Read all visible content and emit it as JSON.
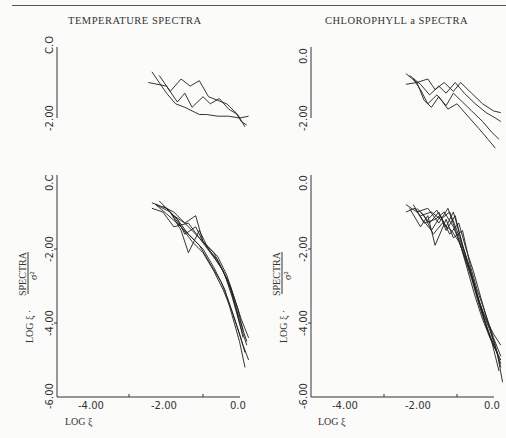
{
  "header": {
    "left_title": "TEMPERATURE SPECTRA",
    "right_title": "CHLOROPHYLL a SPECTRA"
  },
  "axes": {
    "xlabel": "LOG ξ",
    "ylabel": "LOG ξ · SPECTRA / σ²",
    "ylabel_main": "LOG ξ ·",
    "ylabel_frac_num": "SPECTRA",
    "ylabel_frac_den": "σ²",
    "x_ticks": [
      "-4.00",
      "-2.00",
      "0.0"
    ],
    "x_tick_min": "-6.00",
    "y_ticks_lower": [
      "0.0",
      "-2.00",
      "-4.00",
      "-6.00"
    ],
    "y_ticks_upper": [
      "0.0",
      "-2.00"
    ],
    "left_upper_top_tick": "C.O",
    "left_lower_top_tick": "0.C",
    "left_lower_bottom_tick": "-6.00"
  },
  "chart_data": [
    {
      "type": "line",
      "title": "TEMPERATURE SPECTRA (upper panel)",
      "xlabel": "LOG ξ",
      "ylabel": "LOG ξ · SPECTRA/σ²",
      "xlim": [
        -6.0,
        0.0
      ],
      "ylim": [
        -2.0,
        0.0
      ],
      "grid": false,
      "series": [
        {
          "name": "T1",
          "x": [
            -3.4,
            -3.0,
            -2.75,
            -2.5,
            -2.3,
            -2.1,
            -1.9,
            -1.6,
            -1.3,
            -1.0,
            -0.75
          ],
          "y": [
            -0.7,
            -1.3,
            -1.6,
            -1.7,
            -1.8,
            -1.9,
            -1.9,
            -1.95,
            -1.95,
            -2.0,
            -1.95
          ]
        },
        {
          "name": "T2",
          "x": [
            -3.2,
            -2.9,
            -2.6,
            -2.35,
            -2.1,
            -1.85,
            -1.6,
            -1.35,
            -1.1,
            -0.95,
            -0.8
          ],
          "y": [
            -0.8,
            -1.25,
            -0.9,
            -1.1,
            -0.95,
            -1.4,
            -1.5,
            -1.6,
            -1.85,
            -2.1,
            -2.2
          ]
        },
        {
          "name": "T3",
          "x": [
            -3.5,
            -3.0,
            -2.7,
            -2.5,
            -2.3,
            -2.0,
            -1.8,
            -1.55,
            -1.3,
            -1.05,
            -0.85
          ],
          "y": [
            -1.0,
            -1.1,
            -1.55,
            -1.3,
            -1.7,
            -1.4,
            -1.6,
            -1.45,
            -1.75,
            -1.9,
            -2.25
          ]
        }
      ]
    },
    {
      "type": "line",
      "title": "TEMPERATURE SPECTRA (lower panel)",
      "xlabel": "LOG ξ",
      "ylabel": "LOG ξ · SPECTRA/σ²",
      "xlim": [
        -6.0,
        0.0
      ],
      "ylim": [
        -6.0,
        0.0
      ],
      "grid": false,
      "series": [
        {
          "name": "T-a",
          "x": [
            -3.4,
            -3.0,
            -2.7,
            -2.5,
            -2.2,
            -2.0,
            -1.7,
            -1.4,
            -1.2,
            -1.0,
            -0.8
          ],
          "y": [
            -0.75,
            -0.9,
            -1.2,
            -1.6,
            -1.4,
            -1.8,
            -2.1,
            -2.7,
            -3.3,
            -4.0,
            -4.6
          ]
        },
        {
          "name": "T-b",
          "x": [
            -3.3,
            -2.9,
            -2.6,
            -2.4,
            -2.1,
            -1.85,
            -1.6,
            -1.3,
            -1.1,
            -0.9
          ],
          "y": [
            -0.8,
            -1.0,
            -1.5,
            -2.1,
            -1.5,
            -2.0,
            -2.3,
            -2.9,
            -3.6,
            -4.4
          ]
        },
        {
          "name": "T-c",
          "x": [
            -3.2,
            -2.8,
            -2.5,
            -2.2,
            -2.0,
            -1.7,
            -1.45,
            -1.2,
            -1.0,
            -0.8
          ],
          "y": [
            -0.7,
            -1.1,
            -1.3,
            -1.1,
            -1.8,
            -2.2,
            -2.6,
            -3.2,
            -3.9,
            -4.5
          ]
        },
        {
          "name": "T-d",
          "x": [
            -3.0,
            -2.7,
            -2.4,
            -2.1,
            -1.8,
            -1.5,
            -1.3,
            -1.1,
            -0.9,
            -0.75
          ],
          "y": [
            -0.9,
            -1.2,
            -1.6,
            -1.9,
            -2.4,
            -2.9,
            -3.4,
            -4.0,
            -4.6,
            -5.0
          ]
        },
        {
          "name": "T-e",
          "x": [
            -3.3,
            -3.0,
            -2.6,
            -2.3,
            -2.0,
            -1.7,
            -1.4,
            -1.2,
            -1.0,
            -0.85
          ],
          "y": [
            -0.8,
            -1.05,
            -1.4,
            -1.7,
            -2.0,
            -2.5,
            -3.1,
            -3.8,
            -4.5,
            -5.2
          ]
        },
        {
          "name": "T-f",
          "x": [
            -3.1,
            -2.8,
            -2.5,
            -2.2,
            -1.9,
            -1.6,
            -1.35,
            -1.15,
            -0.95,
            -0.75
          ],
          "y": [
            -0.85,
            -1.0,
            -1.3,
            -1.6,
            -1.9,
            -2.2,
            -2.7,
            -3.3,
            -3.9,
            -4.4
          ]
        },
        {
          "name": "T-g",
          "x": [
            -3.4,
            -3.1,
            -2.8,
            -2.4,
            -2.1,
            -1.8,
            -1.5,
            -1.25,
            -1.05,
            -0.9
          ],
          "y": [
            -0.9,
            -1.0,
            -1.4,
            -1.3,
            -1.7,
            -2.1,
            -2.5,
            -3.0,
            -3.6,
            -4.2
          ]
        },
        {
          "name": "T-h",
          "x": [
            -2.9,
            -2.6,
            -2.3,
            -2.0,
            -1.7,
            -1.45,
            -1.2,
            -1.0,
            -0.85
          ],
          "y": [
            -1.0,
            -1.4,
            -1.8,
            -2.1,
            -2.6,
            -3.1,
            -3.7,
            -4.3,
            -4.8
          ]
        }
      ]
    },
    {
      "type": "line",
      "title": "CHLOROPHYLL a SPECTRA (upper panel)",
      "xlabel": "LOG ξ",
      "ylabel": "LOG ξ · SPECTRA/σ²",
      "xlim": [
        -6.0,
        0.0
      ],
      "ylim": [
        -2.0,
        0.0
      ],
      "grid": false,
      "series": [
        {
          "name": "C1",
          "x": [
            -3.4,
            -3.1,
            -2.8,
            -2.6,
            -2.35,
            -2.1,
            -1.9,
            -1.6,
            -1.3,
            -1.0,
            -0.8
          ],
          "y": [
            -0.75,
            -1.0,
            -0.9,
            -1.2,
            -1.0,
            -1.25,
            -1.0,
            -1.3,
            -1.6,
            -1.8,
            -1.85
          ]
        },
        {
          "name": "C2",
          "x": [
            -3.3,
            -3.0,
            -2.75,
            -2.5,
            -2.3,
            -2.05,
            -1.8,
            -1.5,
            -1.2,
            -0.95,
            -0.8
          ],
          "y": [
            -0.8,
            -1.05,
            -1.35,
            -1.1,
            -1.3,
            -1.0,
            -1.3,
            -1.6,
            -1.85,
            -2.0,
            -2.1
          ]
        },
        {
          "name": "C3",
          "x": [
            -3.2,
            -3.0,
            -2.8,
            -2.55,
            -2.3,
            -2.1,
            -1.85,
            -1.6,
            -1.3,
            -1.05,
            -0.85
          ],
          "y": [
            -0.9,
            -1.2,
            -1.6,
            -1.35,
            -1.65,
            -1.3,
            -1.55,
            -1.8,
            -2.1,
            -2.4,
            -2.6
          ]
        },
        {
          "name": "C4",
          "x": [
            -3.4,
            -3.1,
            -2.9,
            -2.7,
            -2.5,
            -2.25,
            -2.0,
            -1.7,
            -1.4,
            -1.15,
            -0.95
          ],
          "y": [
            -1.05,
            -1.0,
            -1.5,
            -1.7,
            -1.4,
            -1.75,
            -1.6,
            -1.95,
            -2.3,
            -2.6,
            -2.85
          ]
        }
      ]
    },
    {
      "type": "line",
      "title": "CHLOROPHYLL a SPECTRA (lower panel)",
      "xlabel": "LOG ξ",
      "ylabel": "LOG ξ · SPECTRA/σ²",
      "xlim": [
        -6.0,
        0.0
      ],
      "ylim": [
        -6.0,
        0.0
      ],
      "grid": false,
      "series": [
        {
          "name": "C-a",
          "x": [
            -3.4,
            -3.1,
            -2.8,
            -2.5,
            -2.25,
            -2.0,
            -1.8,
            -1.6,
            -1.4,
            -1.2,
            -1.0,
            -0.8
          ],
          "y": [
            -0.8,
            -1.0,
            -0.9,
            -1.3,
            -0.9,
            -1.6,
            -2.2,
            -2.8,
            -3.5,
            -4.1,
            -4.6,
            -5.0
          ]
        },
        {
          "name": "C-b",
          "x": [
            -3.3,
            -3.0,
            -2.8,
            -2.6,
            -2.3,
            -2.1,
            -1.85,
            -1.65,
            -1.45,
            -1.2,
            -1.0,
            -0.8
          ],
          "y": [
            -0.9,
            -1.4,
            -1.1,
            -1.9,
            -1.2,
            -1.7,
            -1.5,
            -2.4,
            -3.1,
            -3.8,
            -4.4,
            -4.9
          ]
        },
        {
          "name": "C-c",
          "x": [
            -3.2,
            -2.95,
            -2.7,
            -2.45,
            -2.2,
            -1.95,
            -1.75,
            -1.55,
            -1.35,
            -1.15,
            -0.95,
            -0.8
          ],
          "y": [
            -0.8,
            -1.2,
            -1.5,
            -1.1,
            -1.6,
            -1.3,
            -2.0,
            -2.6,
            -3.3,
            -4.0,
            -4.6,
            -5.2
          ]
        },
        {
          "name": "C-d",
          "x": [
            -3.0,
            -2.75,
            -2.5,
            -2.3,
            -2.05,
            -1.85,
            -1.65,
            -1.45,
            -1.25,
            -1.05,
            -0.85
          ],
          "y": [
            -1.0,
            -1.3,
            -1.0,
            -1.5,
            -1.1,
            -1.9,
            -2.5,
            -3.2,
            -3.9,
            -4.5,
            -5.3
          ]
        },
        {
          "name": "C-e",
          "x": [
            -3.4,
            -3.15,
            -2.9,
            -2.6,
            -2.35,
            -2.1,
            -1.9,
            -1.7,
            -1.5,
            -1.3,
            -1.1,
            -0.9
          ],
          "y": [
            -1.0,
            -0.9,
            -1.3,
            -1.2,
            -1.0,
            -1.4,
            -1.9,
            -2.6,
            -3.3,
            -3.9,
            -4.4,
            -4.8
          ]
        },
        {
          "name": "C-f",
          "x": [
            -3.1,
            -2.9,
            -2.65,
            -2.4,
            -2.15,
            -1.95,
            -1.75,
            -1.55,
            -1.35,
            -1.15,
            -0.95,
            -0.8
          ],
          "y": [
            -0.9,
            -1.1,
            -1.6,
            -1.3,
            -1.5,
            -1.8,
            -2.3,
            -2.9,
            -3.6,
            -4.2,
            -4.7,
            -5.1
          ]
        },
        {
          "name": "C-g",
          "x": [
            -2.8,
            -2.55,
            -2.3,
            -2.1,
            -1.9,
            -1.7,
            -1.5,
            -1.3,
            -1.1,
            -0.9,
            -0.75
          ],
          "y": [
            -1.2,
            -0.95,
            -1.4,
            -1.0,
            -1.7,
            -2.4,
            -3.1,
            -3.7,
            -4.2,
            -4.8,
            -5.6
          ]
        },
        {
          "name": "C-h",
          "x": [
            -3.0,
            -2.7,
            -2.45,
            -2.2,
            -2.0,
            -1.8,
            -1.6,
            -1.4,
            -1.2,
            -1.0,
            -0.8
          ],
          "y": [
            -1.1,
            -1.0,
            -1.2,
            -1.0,
            -1.5,
            -2.1,
            -2.7,
            -3.4,
            -3.9,
            -4.3,
            -4.6
          ]
        }
      ]
    }
  ]
}
